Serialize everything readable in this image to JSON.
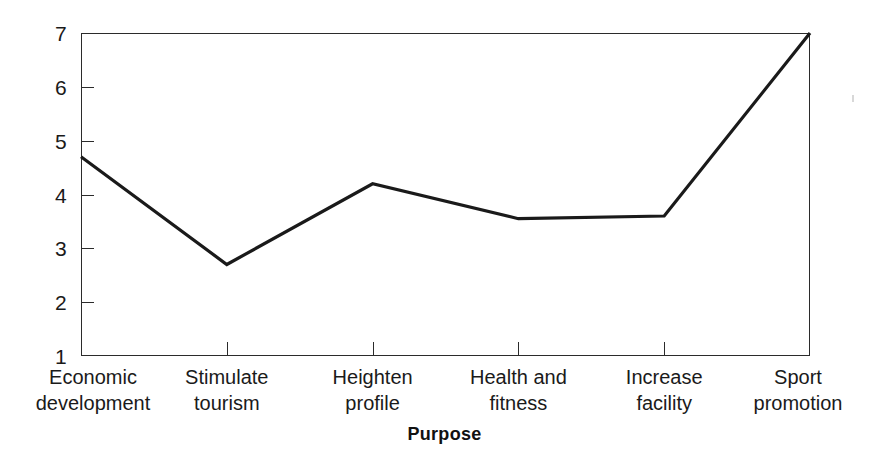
{
  "chart_data": {
    "type": "line",
    "title": "",
    "xlabel": "Purpose",
    "ylabel": "",
    "categories": [
      "Economic\ndevelopment",
      "Stimulate\ntourism",
      "Heighten\nprofile",
      "Health and\nfitness",
      "Increase\nfacility",
      "Sport\npromotion"
    ],
    "values": [
      4.7,
      2.7,
      4.2,
      3.55,
      3.6,
      7.0
    ],
    "ylim": [
      1,
      7
    ],
    "yticks": [
      1,
      2,
      3,
      4,
      5,
      6,
      7
    ],
    "ytick_labels": [
      "1",
      "2",
      "3",
      "4",
      "5",
      "6",
      "7"
    ],
    "grid": false,
    "legend": false,
    "series": [
      {
        "name": "Mean rating",
        "values": [
          4.7,
          2.7,
          4.2,
          3.55,
          3.6,
          7.0
        ]
      }
    ],
    "line_color": "#1a1a1a",
    "line_width": 3.2,
    "frame_color": "#2b2b2b",
    "background_color": "#ffffff"
  },
  "axis_titles": {
    "x": "Purpose"
  }
}
